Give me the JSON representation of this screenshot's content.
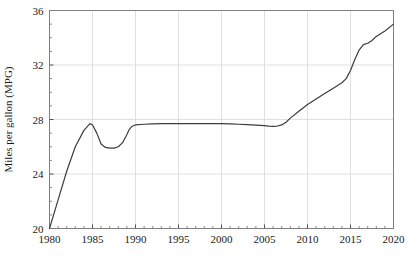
{
  "chart_data": {
    "type": "line",
    "title": "",
    "xlabel": "",
    "ylabel": "Miles per gallon (MPG)",
    "xlim": [
      1980,
      2020
    ],
    "ylim": [
      20,
      36
    ],
    "xticks": [
      1980,
      1985,
      1990,
      1995,
      2000,
      2005,
      2010,
      2015,
      2020
    ],
    "yticks": [
      20,
      24,
      28,
      32,
      36
    ],
    "xticklabels": [
      "1980",
      "1985",
      "1990",
      "1995",
      "2000",
      "2005",
      "2010",
      "2015",
      "2020"
    ],
    "yticklabels": [
      "20",
      "24",
      "28",
      "32",
      "36"
    ],
    "x_minor_tick_interval": 1,
    "y_minor_tick_interval": 1,
    "grid": true,
    "grid_color": "#dcdcdc",
    "legend": false,
    "legend_position": "none",
    "line_color": "#3c3c3c",
    "line_width": 1.2,
    "axes_color": "#808080",
    "background_color": "#ffffff",
    "series": [
      {
        "name": "Fuel economy",
        "x": [
          1980,
          1981,
          1982,
          1983,
          1984,
          1984.7,
          1985,
          1985.5,
          1986,
          1986.5,
          1987,
          1987.5,
          1988,
          1988.5,
          1989,
          1989.3,
          1989.6,
          1990,
          1991,
          1992,
          1993,
          1994,
          1995,
          1996,
          1997,
          1998,
          1999,
          2000,
          2001,
          2002,
          2003,
          2004,
          2005,
          2005.5,
          2006,
          2006.5,
          2007,
          2007.5,
          2008,
          2009,
          2010,
          2011,
          2012,
          2013,
          2014,
          2014.5,
          2015,
          2015.5,
          2016,
          2016.5,
          2017,
          2017.5,
          2018,
          2019,
          2020
        ],
        "y": [
          20.0,
          22.1,
          24.2,
          26.0,
          27.2,
          27.7,
          27.6,
          27.0,
          26.2,
          25.95,
          25.9,
          25.9,
          26.0,
          26.3,
          26.9,
          27.3,
          27.5,
          27.6,
          27.65,
          27.68,
          27.7,
          27.7,
          27.7,
          27.7,
          27.7,
          27.7,
          27.7,
          27.7,
          27.68,
          27.65,
          27.62,
          27.58,
          27.55,
          27.52,
          27.5,
          27.52,
          27.6,
          27.8,
          28.1,
          28.6,
          29.1,
          29.5,
          29.9,
          30.3,
          30.7,
          31.0,
          31.6,
          32.4,
          33.1,
          33.5,
          33.6,
          33.8,
          34.1,
          34.5,
          35.0
        ]
      }
    ]
  }
}
